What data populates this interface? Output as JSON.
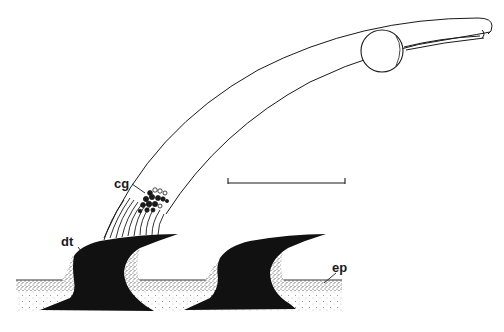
{
  "figure": {
    "labels": {
      "cg": "cg",
      "dt": "dt",
      "ep": "ep"
    },
    "scale_bar": {
      "x1": 228,
      "x2": 345,
      "y": 183
    },
    "colors": {
      "ink": "#1a1a1a",
      "stipple": "#555555",
      "background": "#ffffff"
    }
  }
}
